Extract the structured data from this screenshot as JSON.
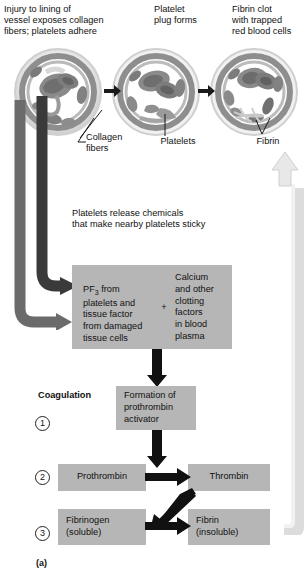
{
  "figure": {
    "caption": "(a)",
    "panel_headings": [
      {
        "id": "panel-1",
        "text": "Injury to lining of\nvessel exposes collagen\nfibers; platelets adhere"
      },
      {
        "id": "panel-2",
        "text": "Platelet\nplug forms"
      },
      {
        "id": "panel-3",
        "text": "Fibrin clot\nwith trapped\nred blood cells"
      }
    ],
    "micrograph_labels": [
      {
        "id": "label-collagen",
        "text": "Collagen\nfibers"
      },
      {
        "id": "label-platelets",
        "text": "Platelets"
      },
      {
        "id": "label-fibrin",
        "text": "Fibrin"
      }
    ],
    "release_note": "Platelets release chemicals\nthat make nearby platelets sticky",
    "reactants_box": {
      "left_text_line1": "PF",
      "left_text_sub": "3",
      "left_text_rest": " from\nplatelets and\ntissue factor\nfrom damaged\ntissue cells",
      "plus": "+",
      "right_text": "Calcium\nand other\nclotting\nfactors\nin blood\nplasma"
    },
    "coagulation_label": "Coagulation",
    "steps": [
      {
        "number": "1",
        "box": "Formation of\nprothrombin\nactivator"
      },
      {
        "number": "2",
        "box_left": "Prothrombin",
        "box_right": "Thrombin"
      },
      {
        "number": "3",
        "box_left": "Fibrinogen\n(soluble)",
        "box_right": "Fibrin\n(insoluble)"
      }
    ]
  },
  "colors": {
    "box_fill": "#b6b6b6",
    "dark_arrow": "#2b2b2b",
    "mid_arrow": "#5a5a5a",
    "light_arrow": "#dcdcdc",
    "text": "#111111"
  }
}
